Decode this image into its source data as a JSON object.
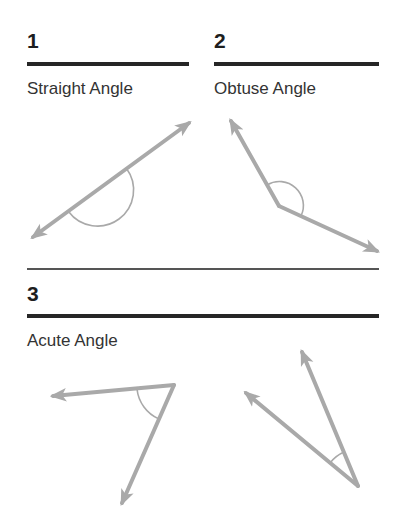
{
  "sections": [
    {
      "number": "1",
      "title": "Straight Angle"
    },
    {
      "number": "2",
      "title": "Obtuse Angle"
    },
    {
      "number": "3",
      "title": "Acute Angle"
    }
  ],
  "colors": {
    "heading_rule": "#262626",
    "ray": "#a9a9a9",
    "arc": "#a9a9a9",
    "text": "#333333"
  },
  "figures": [
    {
      "name": "straight-angle",
      "type": "straight",
      "vertex": [
        97,
        190
      ],
      "rays_to": [
        [
          33,
          237
        ],
        [
          189,
          123
        ]
      ]
    },
    {
      "name": "obtuse-angle",
      "type": "obtuse",
      "vertex": [
        279,
        206
      ],
      "rays_to": [
        [
          231,
          121
        ],
        [
          377,
          251
        ]
      ]
    },
    {
      "name": "acute-angle-left",
      "type": "acute",
      "vertex": [
        174,
        385
      ],
      "rays_to": [
        [
          53,
          396
        ],
        [
          122,
          503
        ]
      ]
    },
    {
      "name": "acute-angle-right",
      "type": "acute",
      "vertex": [
        358,
        486
      ],
      "rays_to": [
        [
          302,
          352
        ],
        [
          246,
          393
        ]
      ]
    }
  ]
}
